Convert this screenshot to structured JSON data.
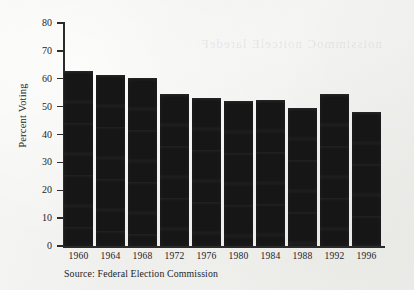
{
  "chart_data": {
    "type": "bar",
    "title": "",
    "xlabel": "",
    "ylabel": "Percent Voting",
    "categories": [
      "1960",
      "1964",
      "1968",
      "1972",
      "1976",
      "1980",
      "1984",
      "1988",
      "1992",
      "1996"
    ],
    "values": [
      62.8,
      61.5,
      60.3,
      54.7,
      53.0,
      52.0,
      52.5,
      49.5,
      54.5,
      48.0
    ],
    "ylim": [
      0,
      80
    ],
    "yticks": [
      0,
      10,
      20,
      30,
      40,
      50,
      60,
      70,
      80
    ],
    "ytick_labels": [
      "0",
      "10",
      "20",
      "30",
      "40",
      "50",
      "60",
      "70",
      "80"
    ],
    "grid": false,
    "legend": null,
    "bar_color": "#161616",
    "axis_color": "#2b2b2b",
    "background_color": "#f3f3f1"
  },
  "annotations": {
    "source_note": "Source: Federal Election Commission",
    "bleed_through_text": "noissimmoC noitcelE laredeF"
  }
}
